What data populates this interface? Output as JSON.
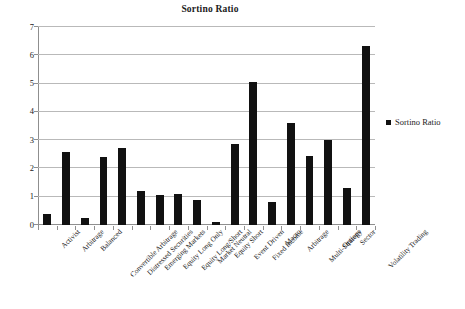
{
  "chart_data": {
    "type": "bar",
    "title": "Sortino Ratio",
    "xlabel": "",
    "ylabel": "",
    "ylim": [
      0,
      7
    ],
    "yticks": [
      0,
      1,
      2,
      3,
      4,
      5,
      6,
      7
    ],
    "grid": true,
    "legend_position": "right",
    "bar_color": "#111111",
    "categories": [
      "Activist",
      "Arbitrage",
      "Balanced",
      "Convertible Arbitrage",
      "Distressed Securities",
      "Emerging Markets",
      "Equity Long Only",
      "Equity Long/Short",
      "Market Neutral",
      "Equity Short",
      "Event Driven",
      "Fixed Income",
      "Macro",
      "Arbitrage",
      "Multi-Strategy",
      "Options",
      "Sector",
      "Volatility Trading"
    ],
    "series": [
      {
        "name": "Sortino Ratio",
        "values": [
          0.38,
          2.58,
          0.24,
          2.42,
          2.74,
          1.19,
          1.05,
          1.1,
          0.87,
          0.09,
          2.85,
          5.04,
          0.82,
          3.61,
          2.45,
          3.01,
          1.32,
          6.34
        ]
      }
    ]
  },
  "legend": {
    "entries": [
      {
        "label": "Sortino Ratio",
        "color": "#111111",
        "marker": "square"
      }
    ]
  }
}
